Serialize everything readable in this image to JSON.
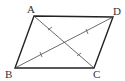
{
  "figure": {
    "type": "parallelogram with diagonals",
    "vertices": [
      {
        "label": "A",
        "x": 34,
        "y": 16,
        "lx": 31,
        "ly": 13
      },
      {
        "label": "D",
        "x": 113,
        "y": 17,
        "lx": 117,
        "ly": 15
      },
      {
        "label": "C",
        "x": 94,
        "y": 68,
        "lx": 97,
        "ly": 78
      },
      {
        "label": "B",
        "x": 15,
        "y": 68,
        "lx": 10,
        "ly": 77
      }
    ],
    "labels": {
      "A": "A",
      "B": "B",
      "C": "C",
      "D": "D"
    },
    "stroke_color": "#222222",
    "diagonal_color": "#444444"
  }
}
